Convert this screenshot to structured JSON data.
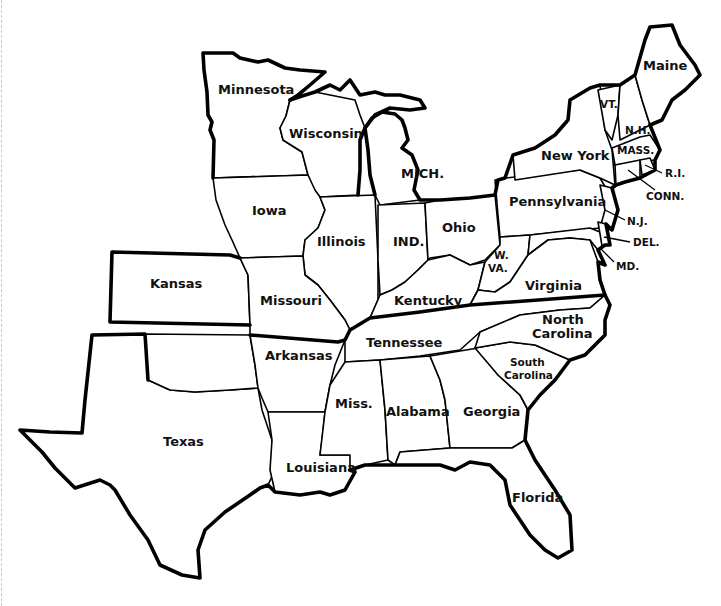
{
  "map": {
    "type": "outline map",
    "region": "Eastern United States",
    "states": [
      {
        "id": "minnesota",
        "label": "Minnesota"
      },
      {
        "id": "wisconsin",
        "label": "Wisconsin"
      },
      {
        "id": "iowa",
        "label": "Iowa"
      },
      {
        "id": "illinois",
        "label": "Illinois"
      },
      {
        "id": "michigan",
        "label": "MICH."
      },
      {
        "id": "indiana",
        "label": "IND."
      },
      {
        "id": "ohio",
        "label": "Ohio"
      },
      {
        "id": "kansas",
        "label": "Kansas"
      },
      {
        "id": "missouri",
        "label": "Missouri"
      },
      {
        "id": "kentucky",
        "label": "Kentucky"
      },
      {
        "id": "west_virginia_1",
        "label": "W."
      },
      {
        "id": "west_virginia_2",
        "label": "VA."
      },
      {
        "id": "virginia",
        "label": "Virginia"
      },
      {
        "id": "pennsylvania",
        "label": "Pennsylvania"
      },
      {
        "id": "new_york",
        "label": "New York"
      },
      {
        "id": "vermont",
        "label": "VT."
      },
      {
        "id": "new_hampshire",
        "label": "N.H."
      },
      {
        "id": "maine",
        "label": "Maine"
      },
      {
        "id": "massachusetts",
        "label": "MASS."
      },
      {
        "id": "rhode_island",
        "label": "R.I."
      },
      {
        "id": "connecticut",
        "label": "CONN."
      },
      {
        "id": "new_jersey",
        "label": "N.J."
      },
      {
        "id": "delaware",
        "label": "DEL."
      },
      {
        "id": "maryland",
        "label": "MD."
      },
      {
        "id": "texas",
        "label": "Texas"
      },
      {
        "id": "arkansas",
        "label": "Arkansas"
      },
      {
        "id": "louisiana",
        "label": "Louisiana"
      },
      {
        "id": "tennessee",
        "label": "Tennessee"
      },
      {
        "id": "mississippi",
        "label": "Miss."
      },
      {
        "id": "alabama",
        "label": "Alabama"
      },
      {
        "id": "georgia",
        "label": "Georgia"
      },
      {
        "id": "florida",
        "label": "Florida"
      },
      {
        "id": "north_carolina_1",
        "label": "North"
      },
      {
        "id": "north_carolina_2",
        "label": "Carolina"
      },
      {
        "id": "south_carolina_1",
        "label": "South"
      },
      {
        "id": "south_carolina_2",
        "label": "Carolina"
      }
    ]
  }
}
